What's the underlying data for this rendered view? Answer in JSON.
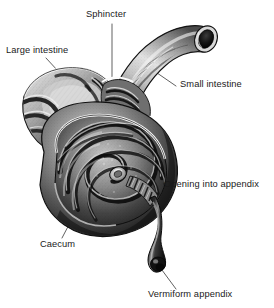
{
  "figure": {
    "style": "grayscale engraving / halftone anatomical illustration",
    "background_color": "#ffffff",
    "ink_color": "#1a1a1a",
    "labels": [
      {
        "id": "large-intestine",
        "text": "Large intestine",
        "align": "left"
      },
      {
        "id": "sphincter",
        "text": "Sphincter",
        "align": "left"
      },
      {
        "id": "small-intestine",
        "text": "Small intestine",
        "align": "left"
      },
      {
        "id": "opening",
        "text": "Opening into appendix",
        "align": "left"
      },
      {
        "id": "caecum",
        "text": "Caecum",
        "align": "left"
      },
      {
        "id": "vermiform",
        "text": "Vermiform appendix",
        "align": "left"
      }
    ],
    "structures": [
      {
        "name": "large-intestine",
        "description": "cut-open colon with haustral folds, upper left"
      },
      {
        "name": "small-intestine",
        "description": "curved ileum tube entering from upper right with dark cut lumen"
      },
      {
        "name": "sphincter",
        "description": "ileocaecal valve at junction of ileum and caecum"
      },
      {
        "name": "caecum",
        "description": "large rounded sac with concentric spiral interior ridges"
      },
      {
        "name": "appendix-opening",
        "description": "small orifice at centre of caecal spiral"
      },
      {
        "name": "vermiform-appendix",
        "description": "narrow worm-like tube descending to lower right with bulbous tip"
      }
    ]
  }
}
